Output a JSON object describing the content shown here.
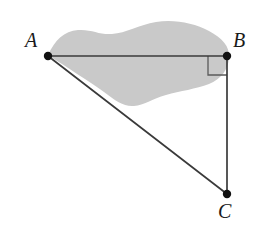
{
  "figure": {
    "kind": "geometry-diagram",
    "background_color": "#ffffff",
    "line_color": "#3a3a3a",
    "vertex_color": "#111111",
    "region_fill_color": "#c9c9c9",
    "region_name": "shaded-irregular-region",
    "canvas": {
      "width": 259,
      "height": 238
    },
    "vertices": [
      {
        "id": "A",
        "label": "A",
        "x": 48,
        "y": 56,
        "label_x": 25,
        "label_y": 30
      },
      {
        "id": "B",
        "label": "B",
        "x": 227,
        "y": 56,
        "label_x": 233,
        "label_y": 30
      },
      {
        "id": "C",
        "label": "C",
        "x": 227,
        "y": 194,
        "label_x": 218,
        "label_y": 201
      }
    ],
    "segments": [
      {
        "name": "segment-AB",
        "from": "A",
        "to": "B"
      },
      {
        "name": "segment-BC",
        "from": "B",
        "to": "C"
      },
      {
        "name": "segment-AC",
        "from": "A",
        "to": "C"
      }
    ],
    "right_angle": {
      "name": "right-angle-marker-B",
      "at_vertex": "B",
      "size": 19,
      "measure": "90"
    },
    "region_path": "M 48 55 C 55 40 64 31 78 30 C 92 29 99 35 112 34 C 126 33 139 25 156 22 C 174 19 194 23 209 31 C 222 38 230 46 229 58 C 228 70 221 79 209 84 C 196 89 180 91 166 95 C 152 99 144 105 134 106 C 124 107 116 101 104 92 C 90 82 68 68 48 55 Z"
  }
}
